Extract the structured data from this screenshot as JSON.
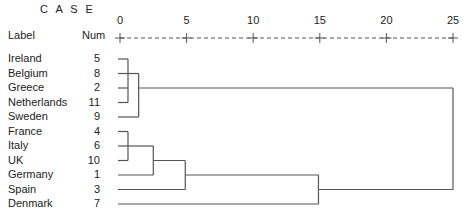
{
  "header": {
    "case_label": "C A S E",
    "label_col": "Label",
    "num_col": "Num"
  },
  "chart_data": {
    "type": "dendrogram",
    "title": "",
    "xlabel": "Rescaled Distance Cluster Combine",
    "x_ticks": [
      0,
      5,
      10,
      15,
      20,
      25
    ],
    "xlim": [
      0,
      25
    ],
    "leaves": [
      {
        "label": "Ireland",
        "num": "5"
      },
      {
        "label": "Belgium",
        "num": "8"
      },
      {
        "label": "Greece",
        "num": "2"
      },
      {
        "label": "Netherlands",
        "num": "11"
      },
      {
        "label": "Sweden",
        "num": "9"
      },
      {
        "label": "France",
        "num": "4"
      },
      {
        "label": "Italy",
        "num": "6"
      },
      {
        "label": "UK",
        "num": "10"
      },
      {
        "label": "Germany",
        "num": "1"
      },
      {
        "label": "Spain",
        "num": "3"
      },
      {
        "label": "Denmark",
        "num": "7"
      }
    ],
    "merges": [
      {
        "members": [
          "Ireland",
          "Belgium",
          "Greece",
          "Netherlands"
        ],
        "distance": 0.6
      },
      {
        "members": [
          "France",
          "Italy",
          "UK"
        ],
        "distance": 0.6
      },
      {
        "members": [
          "Ireland-Netherlands cluster",
          "Sweden"
        ],
        "distance": 1.4
      },
      {
        "members": [
          "France-UK cluster",
          "Germany"
        ],
        "distance": 2.5
      },
      {
        "members": [
          "France-Germany cluster",
          "Spain"
        ],
        "distance": 4.9
      },
      {
        "members": [
          "France-Spain cluster",
          "Denmark"
        ],
        "distance": 14.9
      },
      {
        "members": [
          "Ireland-Sweden cluster",
          "France-Denmark cluster"
        ],
        "distance": 25
      }
    ]
  },
  "colors": {
    "line": "#555555",
    "text": "#222222",
    "background": "#ffffff"
  }
}
